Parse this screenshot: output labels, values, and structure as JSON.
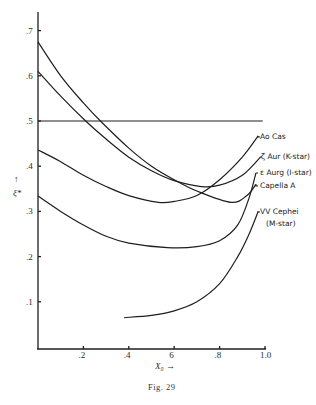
{
  "chart_data": {
    "type": "line",
    "title": "",
    "caption": "Fig. 29",
    "xlabel": "X₀ →",
    "ylabel": "↑ ξ*",
    "xlim": [
      0,
      1.0
    ],
    "ylim": [
      0,
      0.75
    ],
    "x_ticks": [
      0.2,
      0.4,
      0.6,
      0.8,
      1.0
    ],
    "x_tick_labels": [
      ".2",
      ".4",
      "6",
      ".8",
      "1.0"
    ],
    "y_ticks": [
      0.1,
      0.2,
      0.3,
      0.4,
      0.5,
      0.6,
      0.7
    ],
    "y_tick_labels": [
      ".1",
      ".2",
      ".3",
      ".4",
      ".5",
      ".6",
      ".7"
    ],
    "grid": false,
    "legend_position": "inline labels at right end of curves",
    "series": [
      {
        "name": "Ao Cas",
        "x": [
          0.0,
          0.1,
          0.2,
          0.3,
          0.4,
          0.53,
          0.6,
          0.7,
          0.8,
          0.9,
          0.97
        ],
        "y": [
          0.436,
          0.41,
          0.38,
          0.355,
          0.335,
          0.32,
          0.322,
          0.335,
          0.37,
          0.42,
          0.467
        ]
      },
      {
        "name": "ζ Aur (K-star)",
        "x": [
          0.0,
          0.1,
          0.21,
          0.3,
          0.4,
          0.5,
          0.6,
          0.72,
          0.8,
          0.9,
          0.98
        ],
        "y": [
          0.61,
          0.555,
          0.5,
          0.46,
          0.42,
          0.39,
          0.368,
          0.355,
          0.358,
          0.38,
          0.42
        ]
      },
      {
        "name": "ε Aurg (I-star)",
        "x": [
          0.0,
          0.1,
          0.2,
          0.3,
          0.4,
          0.57,
          0.7,
          0.8,
          0.88,
          0.93,
          0.96
        ],
        "y": [
          0.334,
          0.3,
          0.27,
          0.245,
          0.23,
          0.22,
          0.222,
          0.235,
          0.27,
          0.33,
          0.385
        ]
      },
      {
        "name": "Capella A",
        "x": [
          0.0,
          0.1,
          0.2,
          0.275,
          0.4,
          0.5,
          0.6,
          0.7,
          0.85,
          0.92,
          0.96
        ],
        "y": [
          0.675,
          0.6,
          0.54,
          0.5,
          0.44,
          0.4,
          0.37,
          0.345,
          0.32,
          0.335,
          0.36
        ]
      },
      {
        "name": "VV Cephei (M-star)",
        "x": [
          0.38,
          0.5,
          0.6,
          0.7,
          0.8,
          0.88,
          0.93,
          0.97
        ],
        "y": [
          0.065,
          0.07,
          0.08,
          0.1,
          0.14,
          0.2,
          0.25,
          0.3
        ]
      },
      {
        "name": "reference line ξ* = 0.5",
        "x": [
          0.0,
          0.99
        ],
        "y": [
          0.5,
          0.5
        ]
      }
    ]
  },
  "labels": {
    "ao_cas": "Ao Cas",
    "zeta_aur": "ζ Aur (K-star)",
    "eps_aur": "ε Aurg (I-star)",
    "capella": "Capella A",
    "vv_cephei_1": "VV Cephei",
    "vv_cephei_2": "(M-star)",
    "xlabel": "X₀ →",
    "ylabel_arrow": "↑",
    "ylabel": "ξ*",
    "caption": "Fig. 29"
  }
}
